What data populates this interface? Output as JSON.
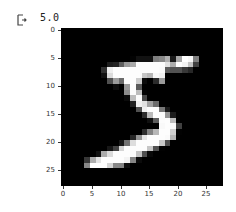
{
  "cell_output": {
    "icon": "output-arrow-icon",
    "text": "5.0"
  },
  "chart_data": {
    "type": "heatmap",
    "title": "",
    "xlabel": "",
    "ylabel": "",
    "colormap": "gray",
    "xlim": [
      -0.5,
      27.5
    ],
    "ylim": [
      27.5,
      -0.5
    ],
    "x_ticks": [
      "0",
      "5",
      "10",
      "15",
      "20",
      "25"
    ],
    "y_ticks": [
      "0",
      "5",
      "10",
      "15",
      "20",
      "25"
    ],
    "grid": false,
    "rows": 28,
    "cols": 28,
    "values": [
      [
        0,
        0,
        0,
        0,
        0,
        0,
        0,
        0,
        0,
        0,
        0,
        0,
        0,
        0,
        0,
        0,
        0,
        0,
        0,
        0,
        0,
        0,
        0,
        0,
        0,
        0,
        0,
        0
      ],
      [
        0,
        0,
        0,
        0,
        0,
        0,
        0,
        0,
        0,
        0,
        0,
        0,
        0,
        0,
        0,
        0,
        0,
        0,
        0,
        0,
        0,
        0,
        0,
        0,
        0,
        0,
        0,
        0
      ],
      [
        0,
        0,
        0,
        0,
        0,
        0,
        0,
        0,
        0,
        0,
        0,
        0,
        0,
        0,
        0,
        0,
        0,
        0,
        0,
        0,
        0,
        0,
        0,
        0,
        0,
        0,
        0,
        0
      ],
      [
        0,
        0,
        0,
        0,
        0,
        0,
        0,
        0,
        0,
        0,
        0,
        0,
        0,
        0,
        0,
        0,
        0,
        0,
        0,
        0,
        0,
        0,
        0,
        0,
        0,
        0,
        0,
        0
      ],
      [
        0,
        0,
        0,
        0,
        0,
        0,
        0,
        0,
        0,
        0,
        0,
        0,
        0,
        0,
        0,
        0,
        0,
        0,
        0,
        0,
        0,
        0,
        0,
        0,
        0,
        0,
        0,
        0
      ],
      [
        0,
        0,
        0,
        0,
        0,
        0,
        0,
        0,
        0,
        0,
        0,
        0,
        3,
        18,
        18,
        18,
        126,
        136,
        175,
        26,
        166,
        255,
        247,
        127,
        0,
        0,
        0,
        0
      ],
      [
        0,
        0,
        0,
        0,
        0,
        0,
        0,
        0,
        30,
        36,
        94,
        154,
        170,
        253,
        253,
        253,
        253,
        253,
        225,
        172,
        253,
        242,
        195,
        64,
        0,
        0,
        0,
        0
      ],
      [
        0,
        0,
        0,
        0,
        0,
        0,
        0,
        49,
        238,
        253,
        253,
        253,
        253,
        253,
        253,
        253,
        253,
        251,
        93,
        82,
        82,
        56,
        39,
        0,
        0,
        0,
        0,
        0
      ],
      [
        0,
        0,
        0,
        0,
        0,
        0,
        0,
        18,
        219,
        253,
        253,
        253,
        253,
        253,
        198,
        182,
        247,
        241,
        0,
        0,
        0,
        0,
        0,
        0,
        0,
        0,
        0,
        0
      ],
      [
        0,
        0,
        0,
        0,
        0,
        0,
        0,
        0,
        80,
        156,
        107,
        253,
        253,
        205,
        11,
        0,
        43,
        154,
        0,
        0,
        0,
        0,
        0,
        0,
        0,
        0,
        0,
        0
      ],
      [
        0,
        0,
        0,
        0,
        0,
        0,
        0,
        0,
        0,
        14,
        1,
        154,
        253,
        90,
        0,
        0,
        0,
        0,
        0,
        0,
        0,
        0,
        0,
        0,
        0,
        0,
        0,
        0
      ],
      [
        0,
        0,
        0,
        0,
        0,
        0,
        0,
        0,
        0,
        0,
        0,
        139,
        253,
        190,
        2,
        0,
        0,
        0,
        0,
        0,
        0,
        0,
        0,
        0,
        0,
        0,
        0,
        0
      ],
      [
        0,
        0,
        0,
        0,
        0,
        0,
        0,
        0,
        0,
        0,
        0,
        11,
        190,
        253,
        70,
        0,
        0,
        0,
        0,
        0,
        0,
        0,
        0,
        0,
        0,
        0,
        0,
        0
      ],
      [
        0,
        0,
        0,
        0,
        0,
        0,
        0,
        0,
        0,
        0,
        0,
        0,
        35,
        241,
        225,
        160,
        108,
        1,
        0,
        0,
        0,
        0,
        0,
        0,
        0,
        0,
        0,
        0
      ],
      [
        0,
        0,
        0,
        0,
        0,
        0,
        0,
        0,
        0,
        0,
        0,
        0,
        0,
        81,
        240,
        253,
        253,
        119,
        25,
        0,
        0,
        0,
        0,
        0,
        0,
        0,
        0,
        0
      ],
      [
        0,
        0,
        0,
        0,
        0,
        0,
        0,
        0,
        0,
        0,
        0,
        0,
        0,
        0,
        45,
        186,
        253,
        253,
        150,
        27,
        0,
        0,
        0,
        0,
        0,
        0,
        0,
        0
      ],
      [
        0,
        0,
        0,
        0,
        0,
        0,
        0,
        0,
        0,
        0,
        0,
        0,
        0,
        0,
        0,
        16,
        93,
        252,
        253,
        187,
        0,
        0,
        0,
        0,
        0,
        0,
        0,
        0
      ],
      [
        0,
        0,
        0,
        0,
        0,
        0,
        0,
        0,
        0,
        0,
        0,
        0,
        0,
        0,
        0,
        0,
        0,
        249,
        253,
        249,
        64,
        0,
        0,
        0,
        0,
        0,
        0,
        0
      ],
      [
        0,
        0,
        0,
        0,
        0,
        0,
        0,
        0,
        0,
        0,
        0,
        0,
        0,
        0,
        46,
        130,
        183,
        253,
        253,
        207,
        2,
        0,
        0,
        0,
        0,
        0,
        0,
        0
      ],
      [
        0,
        0,
        0,
        0,
        0,
        0,
        0,
        0,
        0,
        0,
        0,
        0,
        39,
        148,
        229,
        253,
        253,
        253,
        250,
        182,
        0,
        0,
        0,
        0,
        0,
        0,
        0,
        0
      ],
      [
        0,
        0,
        0,
        0,
        0,
        0,
        0,
        0,
        0,
        0,
        24,
        114,
        221,
        253,
        253,
        253,
        253,
        201,
        78,
        0,
        0,
        0,
        0,
        0,
        0,
        0,
        0,
        0
      ],
      [
        0,
        0,
        0,
        0,
        0,
        0,
        0,
        0,
        23,
        66,
        213,
        253,
        253,
        253,
        253,
        198,
        81,
        2,
        0,
        0,
        0,
        0,
        0,
        0,
        0,
        0,
        0,
        0
      ],
      [
        0,
        0,
        0,
        0,
        0,
        0,
        18,
        171,
        219,
        253,
        253,
        253,
        253,
        195,
        80,
        9,
        0,
        0,
        0,
        0,
        0,
        0,
        0,
        0,
        0,
        0,
        0,
        0
      ],
      [
        0,
        0,
        0,
        0,
        55,
        172,
        226,
        253,
        253,
        253,
        253,
        244,
        133,
        11,
        0,
        0,
        0,
        0,
        0,
        0,
        0,
        0,
        0,
        0,
        0,
        0,
        0,
        0
      ],
      [
        0,
        0,
        0,
        0,
        136,
        253,
        253,
        253,
        212,
        135,
        132,
        16,
        0,
        0,
        0,
        0,
        0,
        0,
        0,
        0,
        0,
        0,
        0,
        0,
        0,
        0,
        0,
        0
      ],
      [
        0,
        0,
        0,
        0,
        0,
        0,
        0,
        0,
        0,
        0,
        0,
        0,
        0,
        0,
        0,
        0,
        0,
        0,
        0,
        0,
        0,
        0,
        0,
        0,
        0,
        0,
        0,
        0
      ],
      [
        0,
        0,
        0,
        0,
        0,
        0,
        0,
        0,
        0,
        0,
        0,
        0,
        0,
        0,
        0,
        0,
        0,
        0,
        0,
        0,
        0,
        0,
        0,
        0,
        0,
        0,
        0,
        0
      ],
      [
        0,
        0,
        0,
        0,
        0,
        0,
        0,
        0,
        0,
        0,
        0,
        0,
        0,
        0,
        0,
        0,
        0,
        0,
        0,
        0,
        0,
        0,
        0,
        0,
        0,
        0,
        0,
        0
      ]
    ]
  },
  "axes": {
    "y_tick_positions_px": [
      31,
      59,
      87,
      115,
      143,
      171
    ],
    "x_tick_positions_px": [
      63,
      92,
      121,
      149,
      178,
      206
    ]
  }
}
